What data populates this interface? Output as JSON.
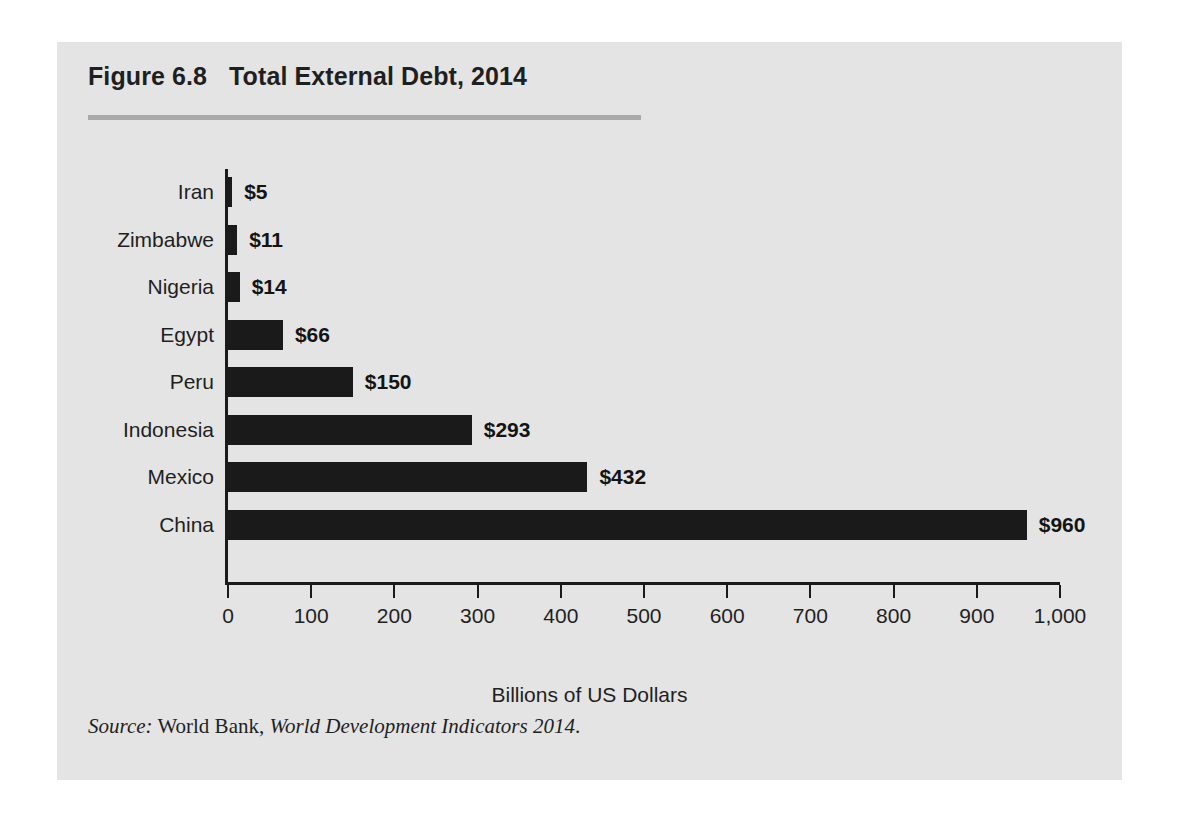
{
  "figure": {
    "number": "Figure 6.8",
    "title": "Total External Debt, 2014",
    "source_prefix": "Source:",
    "source_publisher": "World Bank,",
    "source_work": "World Development Indicators 2014",
    "source_end": "."
  },
  "colors": {
    "panel_background": "#e4e4e4",
    "page_background": "#ffffff",
    "bar": "#1a1a1a",
    "axis": "#1a1a1a",
    "rule": "#a9a9a9",
    "text": "#1f1f1f"
  },
  "chart_data": {
    "type": "bar",
    "orientation": "horizontal",
    "xlabel": "Billions of US Dollars",
    "ylabel": "",
    "xlim": [
      0,
      1000
    ],
    "grid": false,
    "legend": false,
    "categories": [
      "Iran",
      "Zimbabwe",
      "Nigeria",
      "Egypt",
      "Peru",
      "Indonesia",
      "Mexico",
      "China"
    ],
    "values": [
      5,
      11,
      14,
      66,
      150,
      293,
      432,
      960
    ],
    "value_labels": [
      "$5",
      "$11",
      "$14",
      "$66",
      "$150",
      "$293",
      "$432",
      "$960"
    ],
    "xticks": [
      0,
      100,
      200,
      300,
      400,
      500,
      600,
      700,
      800,
      900,
      1000
    ],
    "xtick_labels": [
      "0",
      "100",
      "200",
      "300",
      "400",
      "500",
      "600",
      "700",
      "800",
      "900",
      "1,000"
    ],
    "units": "Billions of US Dollars"
  }
}
